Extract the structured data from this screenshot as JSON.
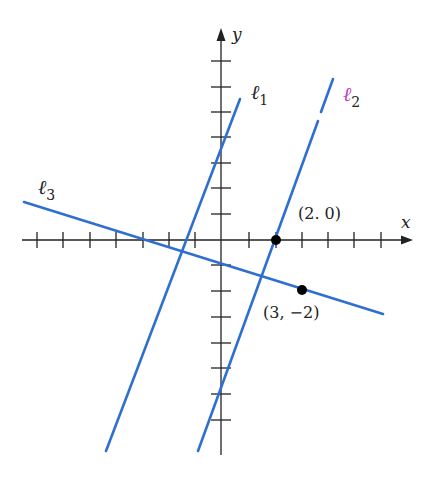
{
  "figure": {
    "axes": {
      "x_label": "x",
      "y_label": "y",
      "origin_px": [
        221,
        240
      ],
      "unit_px_x": 26.4,
      "unit_px_y": 25.6,
      "x_ticks": [
        -7,
        -6,
        -5,
        -4,
        -3,
        -2,
        -1,
        1,
        2,
        3,
        4,
        5,
        6
      ],
      "y_ticks": [
        7,
        6,
        5,
        4,
        3,
        2,
        1,
        -1,
        -2,
        -3,
        -4,
        -5,
        -6,
        -7
      ]
    },
    "lines": [
      {
        "name": "ℓ",
        "subscript": "1",
        "color": "#2f6fd0",
        "label_color": "#222222"
      },
      {
        "name": "ℓ",
        "subscript": "2",
        "color": "#2f6fd0",
        "label_color": "#c040b8"
      },
      {
        "name": "ℓ",
        "subscript": "3",
        "color": "#2f6fd0",
        "label_color": "#222222"
      }
    ],
    "points": [
      {
        "label": "(2. 0)",
        "x": 2,
        "y": 0
      },
      {
        "label": "(3, −2)",
        "x": 3,
        "y": -2
      }
    ],
    "colors": {
      "line": "#2f6fd0",
      "axis": "#222222",
      "point": "#000000"
    }
  }
}
